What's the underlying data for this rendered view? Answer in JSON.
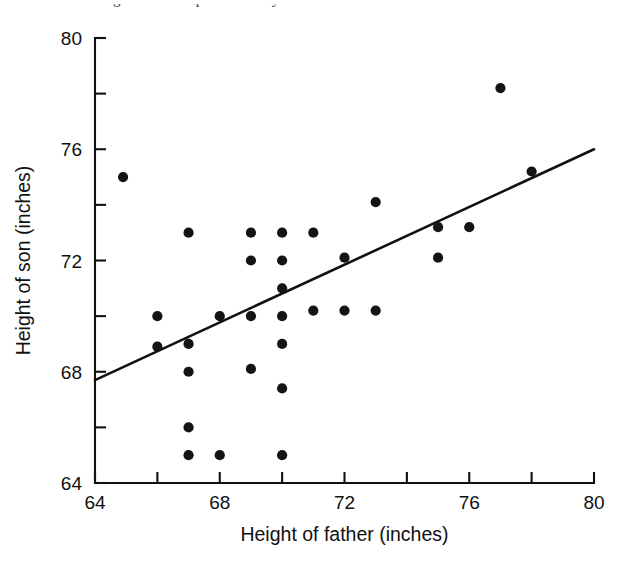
{
  "page": {
    "bleed_text": "son. The regression line predicts the y..."
  },
  "chart_data": {
    "type": "scatter",
    "title": "",
    "xlabel": "Height of father (inches)",
    "ylabel": "Height of son (inches)",
    "xlim": [
      64,
      80
    ],
    "ylim": [
      64,
      80
    ],
    "xticks": [
      64,
      68,
      72,
      76,
      80
    ],
    "xtick_labels": [
      "64",
      "68",
      "72",
      "76",
      "80"
    ],
    "xminor_ticks": [
      66,
      70,
      74,
      78
    ],
    "yticks": [
      64,
      68,
      72,
      76,
      80
    ],
    "ytick_labels": [
      "64",
      "68",
      "72",
      "76",
      "80"
    ],
    "yminor_ticks": [
      66,
      70,
      74,
      78
    ],
    "grid": false,
    "legend": null,
    "marker": "filled-circle",
    "marker_color": "#141414",
    "marker_size_px": 5.1,
    "points": [
      {
        "x": 64.9,
        "y": 75.0
      },
      {
        "x": 66.0,
        "y": 70.0
      },
      {
        "x": 66.0,
        "y": 68.9
      },
      {
        "x": 67.0,
        "y": 73.0
      },
      {
        "x": 67.0,
        "y": 69.0
      },
      {
        "x": 67.0,
        "y": 68.0
      },
      {
        "x": 67.0,
        "y": 66.0
      },
      {
        "x": 67.0,
        "y": 65.0
      },
      {
        "x": 68.0,
        "y": 70.0
      },
      {
        "x": 68.0,
        "y": 65.0
      },
      {
        "x": 69.0,
        "y": 73.0
      },
      {
        "x": 69.0,
        "y": 72.0
      },
      {
        "x": 69.0,
        "y": 70.0
      },
      {
        "x": 69.0,
        "y": 68.1
      },
      {
        "x": 70.0,
        "y": 73.0
      },
      {
        "x": 70.0,
        "y": 72.0
      },
      {
        "x": 70.0,
        "y": 71.0
      },
      {
        "x": 70.0,
        "y": 70.0
      },
      {
        "x": 70.0,
        "y": 69.0
      },
      {
        "x": 70.0,
        "y": 67.4
      },
      {
        "x": 70.0,
        "y": 65.0
      },
      {
        "x": 71.0,
        "y": 73.0
      },
      {
        "x": 71.0,
        "y": 70.2
      },
      {
        "x": 72.0,
        "y": 72.1
      },
      {
        "x": 72.0,
        "y": 70.2
      },
      {
        "x": 73.0,
        "y": 74.1
      },
      {
        "x": 73.0,
        "y": 70.2
      },
      {
        "x": 75.0,
        "y": 73.2
      },
      {
        "x": 75.0,
        "y": 72.1
      },
      {
        "x": 76.0,
        "y": 73.2
      },
      {
        "x": 77.0,
        "y": 78.2
      },
      {
        "x": 78.0,
        "y": 75.2
      }
    ],
    "fit_line": {
      "type": "regression-line",
      "from": {
        "x": 64.0,
        "y": 67.7
      },
      "to": {
        "x": 80.0,
        "y": 76.0
      },
      "color": "#111111"
    }
  }
}
